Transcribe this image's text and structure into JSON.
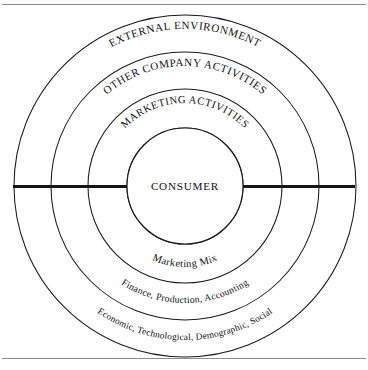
{
  "figure": {
    "background_color": "#ffffff",
    "line_color": "#1a1a1a",
    "rule_color": "#8d8d8d",
    "center": {
      "x": 185,
      "y": 186
    },
    "top_rule_y": 4,
    "bottom_rule_y": 358,
    "axis": {
      "y": 186,
      "x_start": 13,
      "x_end": 355,
      "color": "#151515"
    },
    "center_node": {
      "label": "CONSUMER",
      "radius": 58
    },
    "rings": [
      {
        "id": "marketing-activities",
        "outer_label": "MARKETING ACTIVITIES",
        "inner_label": "Marketing Mix",
        "radius": 97
      },
      {
        "id": "other-company-activities",
        "outer_label": "OTHER COMPANY ACTIVITIES",
        "inner_label": "Finance, Production, Accounting",
        "radius": 134
      },
      {
        "id": "external-environment",
        "outer_label": "EXTERNAL ENVIRONMENT",
        "inner_label": "Economic, Technological, Demographic, Social",
        "radius": 171
      }
    ]
  }
}
